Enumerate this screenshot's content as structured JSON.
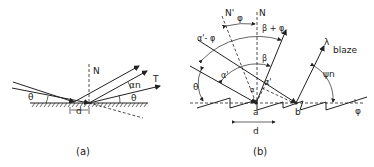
{
  "figure_a": {
    "caption": "(a)",
    "labels": {
      "normal": "N",
      "theta_left": "θ",
      "theta_right": "θ",
      "alpha_n": "αn",
      "transmitted": "T",
      "spacing": "d"
    }
  },
  "figure_b": {
    "caption": "(b)",
    "labels": {
      "normal_prime": "N'",
      "normal": "N",
      "phi_top": "φ",
      "beta_plus_phi": "β + φ",
      "alpha_minus_phi": "α'- φ",
      "beta": "β",
      "alpha": "α'",
      "alpha_prime": "α'",
      "theta": "θ",
      "point_a": "a",
      "point_b": "b",
      "spacing": "d",
      "lambda_blaze_symbol": "λ",
      "blaze": "blaze",
      "psi_n": "ψn",
      "phi_right": "φ",
      "alpha_small": "α"
    }
  }
}
